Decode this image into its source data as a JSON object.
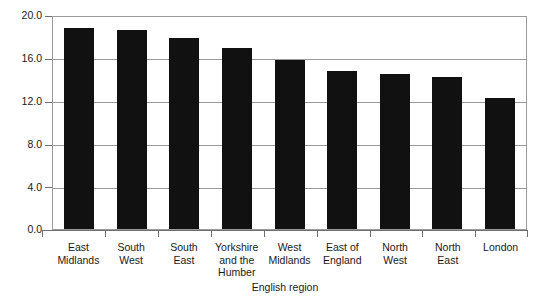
{
  "chart_data": {
    "type": "bar",
    "title": "",
    "subtitle": "",
    "xlabel": "English region",
    "ylabel": "",
    "categories": [
      "East Midlands",
      "South West",
      "South East",
      "Yorkshire and the Humber",
      "West Midlands",
      "East of England",
      "North West",
      "North East",
      "London"
    ],
    "values": [
      19.0,
      18.8,
      18.0,
      17.1,
      15.9,
      14.9,
      14.6,
      14.3,
      12.4
    ],
    "ylim": [
      0.0,
      20.0
    ],
    "yticks": [
      0.0,
      4.0,
      8.0,
      12.0,
      16.0,
      20.0
    ],
    "ytick_labels": [
      "0.0",
      "4.0",
      "8.0",
      "12.0",
      "16.0",
      "20.0"
    ],
    "grid": true,
    "grid_axis": "y",
    "legend": false,
    "legend_position": "none",
    "bar_color": "#111111",
    "axis_color": "#6f6f6f",
    "grid_color": "#9a9a9a",
    "background_color": "#ffffff"
  },
  "axis": {
    "x_title": "English region"
  },
  "category_lines": [
    [
      "East",
      "Midlands"
    ],
    [
      "South",
      "West"
    ],
    [
      "South",
      "East"
    ],
    [
      "Yorkshire",
      "and the",
      "Humber"
    ],
    [
      "West",
      "Midlands"
    ],
    [
      "East of",
      "England"
    ],
    [
      "North",
      "West"
    ],
    [
      "North",
      "East"
    ],
    [
      "London"
    ]
  ]
}
